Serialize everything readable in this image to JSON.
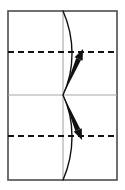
{
  "figure": {
    "kind": "origami-fold-diagram",
    "canvas": {
      "width": 125,
      "height": 190
    },
    "background_color": "#ffffff"
  },
  "sheet": {
    "name": "paper-sheet",
    "x": 8,
    "y": 11,
    "width": 109,
    "height": 169,
    "stroke_color": "#4d4d4d",
    "stroke_width": 1.6,
    "fill_color": "#ffffff"
  },
  "guides": {
    "vertical_center": {
      "label": "vertical center crease",
      "x": 63,
      "y1": 11,
      "y2": 180,
      "color": "#a8a8a8",
      "width": 1.1,
      "style": "solid"
    },
    "horizontal_center": {
      "label": "horizontal center crease",
      "y": 95,
      "x1": 8,
      "x2": 117,
      "color": "#a8a8a8",
      "width": 1.1,
      "style": "solid"
    }
  },
  "fold_lines": [
    {
      "label": "upper valley fold line",
      "y": 52,
      "x1": 8,
      "x2": 117,
      "color": "#111111",
      "width": 2.0,
      "style": "dashed",
      "dash_pattern": "6 4"
    },
    {
      "label": "lower valley fold line",
      "y": 136,
      "x1": 8,
      "x2": 117,
      "color": "#111111",
      "width": 2.0,
      "style": "dashed",
      "dash_pattern": "6 4"
    }
  ],
  "curve": {
    "label": "curved bowed edge of folded paper",
    "color": "#111111",
    "width": 1.4,
    "fill": "none",
    "path": "M 63 11 C 75 38 75 70 63 95 C 75 120 75 152 63 180",
    "bulge_direction": "right",
    "max_bulge_x": 73
  },
  "arrows": [
    {
      "name": "upper-fold-arrow",
      "label": "fold upward arrow",
      "direction": "up-right",
      "origin": {
        "x": 63,
        "y": 95
      },
      "tip": {
        "x": 83,
        "y": 49
      },
      "color": "#111111",
      "shape": "tapered-wedge"
    },
    {
      "name": "lower-fold-arrow",
      "label": "fold downward arrow",
      "direction": "down-right",
      "origin": {
        "x": 63,
        "y": 95
      },
      "tip": {
        "x": 82,
        "y": 140
      },
      "color": "#111111",
      "shape": "tapered-wedge"
    }
  ],
  "quadrants": [
    {
      "name": "top-left-panel"
    },
    {
      "name": "top-right-panel"
    },
    {
      "name": "bottom-left-panel"
    },
    {
      "name": "bottom-right-panel"
    }
  ]
}
